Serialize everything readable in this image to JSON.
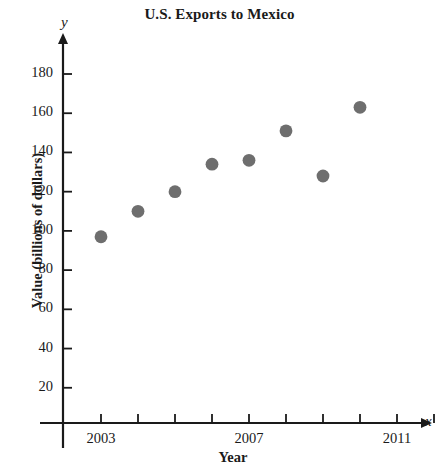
{
  "chart_data": {
    "type": "scatter",
    "title": "U.S. Exports to Mexico",
    "xlabel": "Year",
    "ylabel": "Value (billions of dollars)",
    "x_axis_variable": "x",
    "y_axis_variable": "y",
    "xlim": [
      2002,
      2012.4
    ],
    "ylim": [
      0,
      195
    ],
    "grid": false,
    "legend": null,
    "marker_color": "#6e6e6e",
    "axis_color": "#1a1a1a",
    "x_tick_values": [
      2003,
      2004,
      2005,
      2006,
      2007,
      2008,
      2009,
      2010,
      2011,
      2012
    ],
    "x_tick_labels": [
      "2003",
      "",
      "",
      "",
      "2007",
      "",
      "",
      "",
      "2011",
      ""
    ],
    "y_tick_values": [
      20,
      40,
      60,
      80,
      100,
      120,
      140,
      160,
      180
    ],
    "y_tick_labels": [
      "20",
      "40",
      "60",
      "80",
      "100",
      "120",
      "140",
      "160",
      "180"
    ],
    "x": [
      2003,
      2004,
      2005,
      2006,
      2007,
      2008,
      2009,
      2010
    ],
    "values": [
      97,
      110,
      120,
      134,
      136,
      151,
      128,
      163
    ],
    "points": [
      {
        "x": 2003,
        "y": 97
      },
      {
        "x": 2004,
        "y": 110
      },
      {
        "x": 2005,
        "y": 120
      },
      {
        "x": 2006,
        "y": 134
      },
      {
        "x": 2007,
        "y": 136
      },
      {
        "x": 2008,
        "y": 151
      },
      {
        "x": 2009,
        "y": 128
      },
      {
        "x": 2010,
        "y": 163
      }
    ]
  }
}
